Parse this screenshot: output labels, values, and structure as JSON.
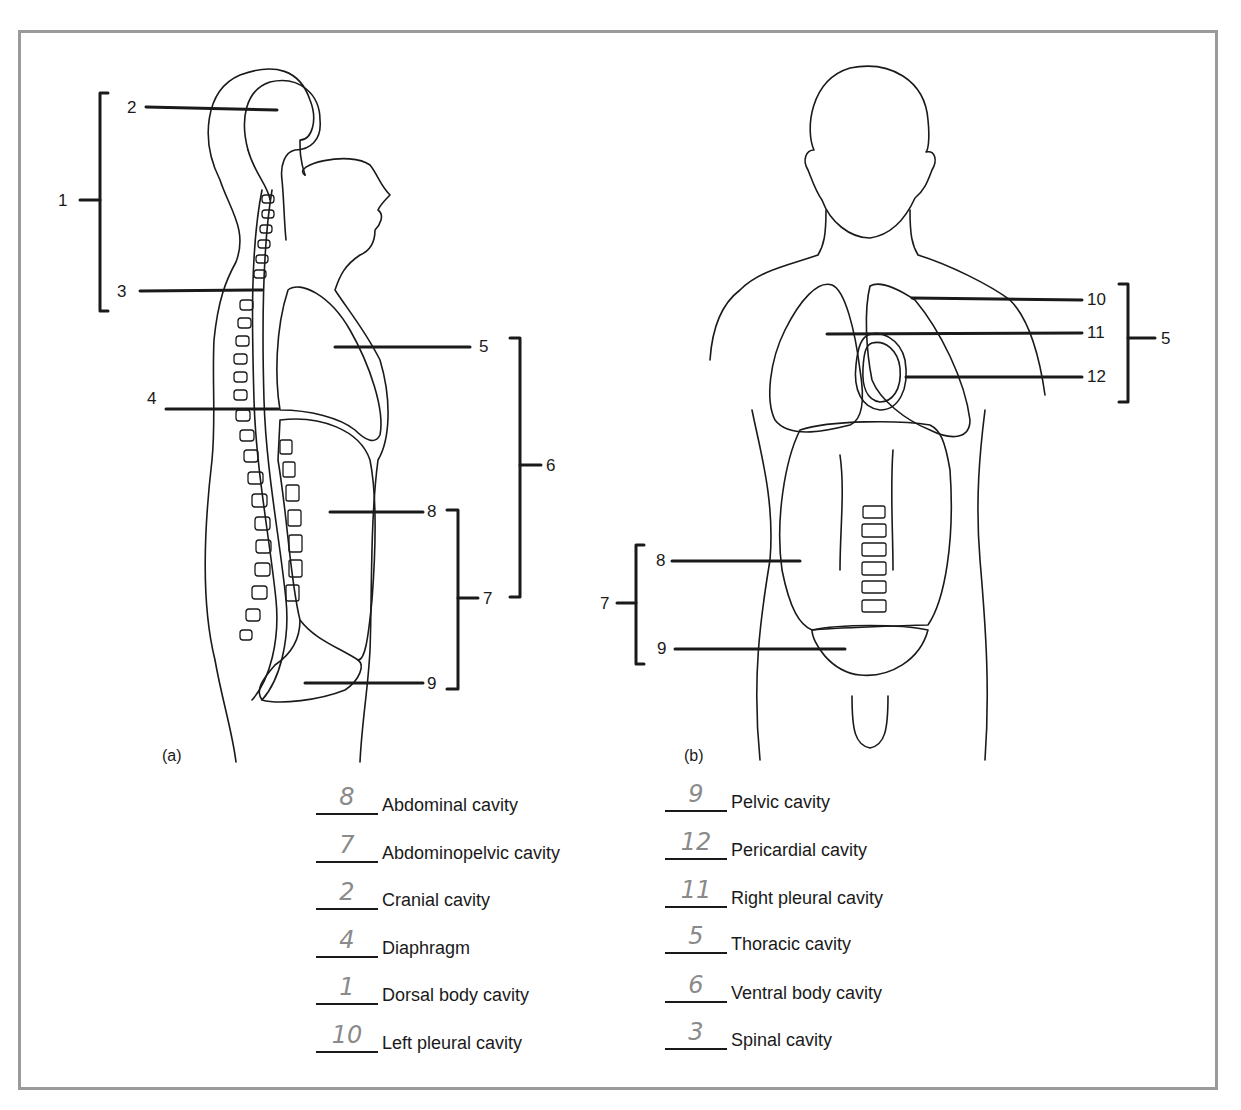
{
  "figure": {
    "panel_a_label": "(a)",
    "panel_b_label": "(b)",
    "panel_a_callouts": [
      {
        "num": "1",
        "target": "dorsal body cavity bracket"
      },
      {
        "num": "2",
        "target": "cranial cavity"
      },
      {
        "num": "3",
        "target": "spinal cavity"
      },
      {
        "num": "4",
        "target": "diaphragm"
      },
      {
        "num": "5",
        "target": "thoracic cavity"
      },
      {
        "num": "6",
        "target": "ventral body cavity bracket"
      },
      {
        "num": "7",
        "target": "abdominopelvic cavity bracket"
      },
      {
        "num": "8",
        "target": "abdominal cavity"
      },
      {
        "num": "9",
        "target": "pelvic cavity"
      }
    ],
    "panel_b_callouts": [
      {
        "num": "10",
        "target": "left pleural cavity"
      },
      {
        "num": "11",
        "target": "right pleural cavity"
      },
      {
        "num": "12",
        "target": "pericardial cavity"
      },
      {
        "num": "5",
        "target": "thoracic cavity bracket"
      },
      {
        "num": "7",
        "target": "abdominopelvic cavity bracket"
      },
      {
        "num": "8",
        "target": "abdominal cavity"
      },
      {
        "num": "9",
        "target": "pelvic cavity"
      }
    ]
  },
  "answer_key": {
    "left_column": [
      {
        "answer": "8",
        "term": "Abdominal cavity"
      },
      {
        "answer": "7",
        "term": "Abdominopelvic cavity"
      },
      {
        "answer": "2",
        "term": "Cranial cavity"
      },
      {
        "answer": "4",
        "term": "Diaphragm"
      },
      {
        "answer": "1",
        "term": "Dorsal body cavity"
      },
      {
        "answer": "10",
        "term": "Left pleural cavity"
      }
    ],
    "right_column": [
      {
        "answer": "9",
        "term": "Pelvic cavity"
      },
      {
        "answer": "12",
        "term": "Pericardial cavity"
      },
      {
        "answer": "11",
        "term": "Right pleural cavity"
      },
      {
        "answer": "5",
        "term": "Thoracic cavity"
      },
      {
        "answer": "6",
        "term": "Ventral body cavity"
      },
      {
        "answer": "3",
        "term": "Spinal cavity"
      }
    ]
  },
  "colors": {
    "frame_border": "#9a9a9a",
    "line_art": "#1a1a1a",
    "handwriting": "#8a8a8a"
  }
}
